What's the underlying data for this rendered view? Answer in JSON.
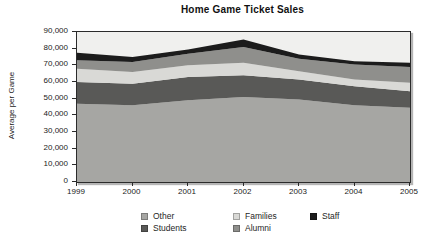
{
  "title": "Home Game Ticket Sales",
  "y_axis": {
    "label": "Average per Game",
    "tick_labels": [
      "90,000",
      "80,000",
      "70,000",
      "60,000",
      "50,000",
      "40,000",
      "30,000",
      "20,000",
      "10,000",
      "0"
    ]
  },
  "x_axis": {
    "tick_labels": [
      "1999",
      "2000",
      "2001",
      "2002",
      "2003",
      "2004",
      "2005"
    ]
  },
  "legend": {
    "items": [
      {
        "label": "Other",
        "color": "#a6a6a3"
      },
      {
        "label": "Families",
        "color": "#d9d9d6"
      },
      {
        "label": "Staff",
        "color": "#1c1c1c"
      },
      {
        "label": "Students",
        "color": "#595957"
      },
      {
        "label": "Alumni",
        "color": "#8f8f8c"
      }
    ]
  },
  "colors": {
    "plot_background": "#f0f0ee",
    "axis": "#2b2b2b",
    "text": "#1a1a1a"
  },
  "chart_data": {
    "type": "area",
    "stacked": true,
    "title": "Home Game Ticket Sales",
    "xlabel": "",
    "ylabel": "Average per Game",
    "x": [
      1999,
      2000,
      2001,
      2002,
      2003,
      2004,
      2005
    ],
    "ylim": [
      0,
      90000
    ],
    "ytick_step": 10000,
    "grid": false,
    "legend_position": "bottom",
    "series": [
      {
        "name": "Other",
        "color": "#a6a6a3",
        "values": [
          47000,
          46000,
          49000,
          51000,
          49500,
          46000,
          44500
        ]
      },
      {
        "name": "Students",
        "color": "#595957",
        "values": [
          13000,
          13000,
          14000,
          13000,
          12000,
          11500,
          10000
        ]
      },
      {
        "name": "Families",
        "color": "#d9d9d6",
        "values": [
          8000,
          7000,
          7000,
          7500,
          5000,
          4000,
          5000
        ]
      },
      {
        "name": "Alumni",
        "color": "#8f8f8c",
        "values": [
          5000,
          6000,
          7000,
          9500,
          7500,
          9000,
          9500
        ]
      },
      {
        "name": "Staff",
        "color": "#1c1c1c",
        "values": [
          4500,
          3000,
          2500,
          4500,
          2500,
          2000,
          2500
        ]
      }
    ]
  }
}
